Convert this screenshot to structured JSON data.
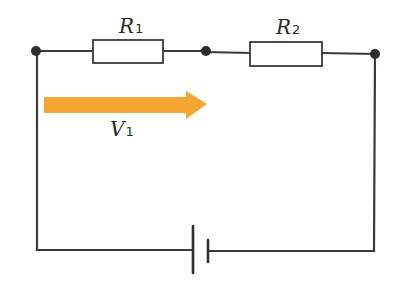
{
  "diagram": {
    "type": "series-circuit",
    "components": [
      {
        "id": "R1",
        "kind": "resistor",
        "symbol": "R",
        "subscript": "1"
      },
      {
        "id": "R2",
        "kind": "resistor",
        "symbol": "R",
        "subscript": "2"
      },
      {
        "id": "battery",
        "kind": "battery"
      }
    ],
    "nodes": [
      "left-node",
      "middle-node",
      "right-node"
    ],
    "voltage_arrow": {
      "symbol": "V",
      "subscript": "1",
      "color": "#f5a534",
      "direction": "right",
      "spans": "R1"
    },
    "colors": {
      "wire": "#3a3a3a",
      "arrow": "#f5a534",
      "background": "#ffffff"
    }
  }
}
